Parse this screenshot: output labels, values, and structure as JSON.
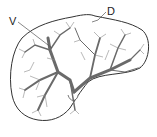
{
  "diagram": {
    "labels": [
      {
        "id": "V",
        "text": "V"
      },
      {
        "id": "D",
        "text": "D"
      }
    ],
    "colors": {
      "outline": "#333333",
      "vessels": "#777777",
      "vessel_trunk": "#5a5a5a",
      "background": "#ffffff"
    }
  }
}
